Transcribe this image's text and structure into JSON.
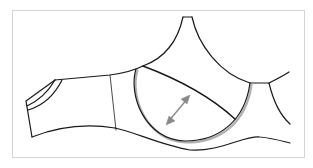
{
  "diagram": {
    "colors": {
      "background": "#ffffff",
      "frame_border": "#d4d4d4",
      "outline": "#1a1a1a",
      "seam_shadow": "#b0b0b0",
      "arrow": "#8a8a8a"
    },
    "annotations": {
      "stretch_arrow": "double-headed diagonal arrow inside cup"
    }
  }
}
